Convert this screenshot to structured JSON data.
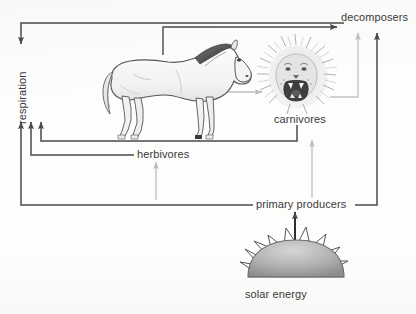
{
  "diagram": {
    "background_color": "#fdfdfc",
    "dark_stroke": "#4a4a4a",
    "grey_stroke": "#b9b9b9",
    "text_color": "#3a3a3a",
    "labels": {
      "respiration": "respiration",
      "decomposers": "decomposers",
      "carnivores": "carnivores",
      "herbivores": "herbivores",
      "primary_producers": "primary producers",
      "solar_energy": "solar energy"
    },
    "illustrations": [
      {
        "name": "horse",
        "label_ref": "herbivores"
      },
      {
        "name": "lion-head",
        "label_ref": "carnivores"
      },
      {
        "name": "sun",
        "label_ref": "solar_energy"
      }
    ],
    "flows": [
      {
        "from": "herbivores",
        "to": "decomposers",
        "color": "dark"
      },
      {
        "from": "carnivores",
        "to": "decomposers",
        "color": "grey"
      },
      {
        "from": "primary producers",
        "to": "decomposers",
        "color": "dark"
      },
      {
        "from": "herbivores",
        "to": "carnivores",
        "color": "grey"
      },
      {
        "from": "primary producers",
        "to": "herbivores",
        "color": "grey"
      },
      {
        "from": "primary producers",
        "to": "carnivores",
        "color": "grey"
      },
      {
        "from": "decomposers",
        "to": "respiration",
        "color": "dark"
      },
      {
        "from": "herbivores",
        "to": "respiration",
        "color": "dark"
      },
      {
        "from": "carnivores",
        "to": "respiration",
        "color": "dark"
      },
      {
        "from": "primary producers",
        "to": "respiration",
        "color": "dark"
      },
      {
        "from": "solar energy",
        "to": "primary producers",
        "color": "dark"
      }
    ]
  }
}
